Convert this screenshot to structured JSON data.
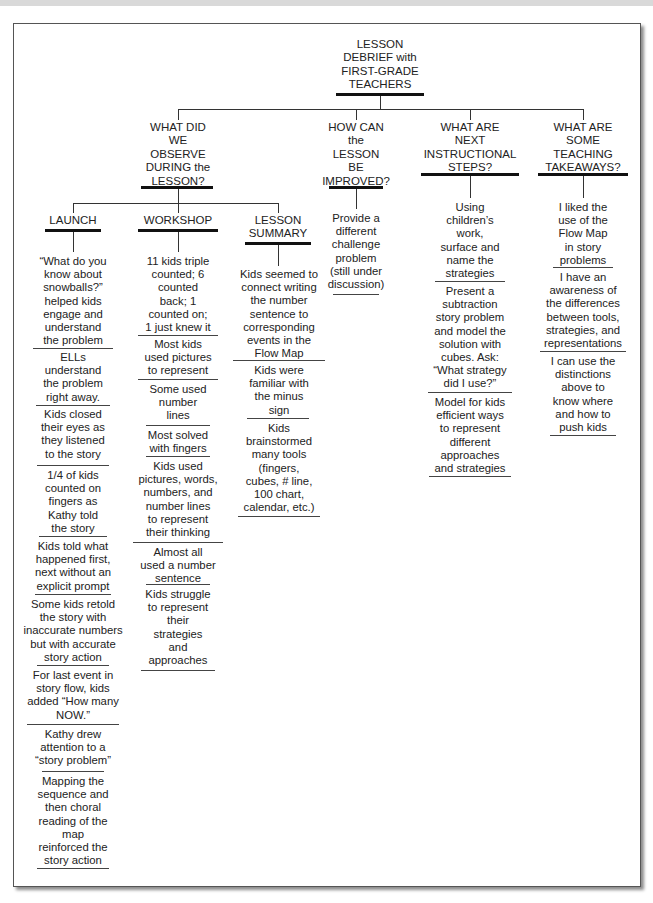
{
  "root": {
    "title": "LESSON\nDEBRIEF with\nFIRST-GRADE\nTEACHERS"
  },
  "questions": [
    {
      "id": "observe",
      "label": "WHAT DID\nWE\nOBSERVE\nDURING the\nLESSON?",
      "subcategories": [
        {
          "label": "LAUNCH",
          "items": [
            "“What do you\nknow about\nsnowballs?”\nhelped kids\nengage and\nunderstand\nthe problem",
            "ELLs\nunderstand\nthe problem\nright away.",
            "Kids closed\ntheir eyes as\nthey listened\nto the story",
            "1/4 of kids\ncounted on\nfingers as\nKathy told\nthe story",
            "Kids told what\nhappened first,\nnext without an\nexplicit prompt",
            "Some kids retold\nthe  story with\ninaccurate numbers\nbut with accurate\nstory action",
            "For last event in\nstory flow, kids\nadded “How many\nNOW.”",
            "Kathy drew\nattention to a\n“story problem”",
            "Mapping the\nsequence and\nthen choral\nreading of the\nmap\nreinforced the\nstory action"
          ]
        },
        {
          "label": "WORKSHOP",
          "items": [
            "11 kids triple\ncounted; 6\ncounted\nback; 1\ncounted on;\n1 just knew it",
            "Most kids\nused pictures\nto represent",
            "Some used\nnumber\nlines",
            "Most solved\nwith fingers",
            "Kids used\npictures, words,\nnumbers, and\nnumber lines\nto represent\ntheir thinking",
            "Almost all\nused a number\nsentence",
            "Kids struggle\nto represent\ntheir\nstrategies\nand\napproaches"
          ]
        },
        {
          "label": "LESSON\nSUMMARY",
          "items": [
            "Kids seemed to\nconnect writing\nthe number\nsentence to\ncorresponding\nevents in the\nFlow Map",
            "Kids were\nfamiliar with\nthe minus\nsign",
            "Kids\nbrainstormed\nmany tools\n(fingers,\ncubes, # line,\n100 chart,\ncalendar, etc.)"
          ]
        }
      ]
    },
    {
      "id": "improve",
      "label": "HOW CAN\nthe\nLESSON\nBE\nIMPROVED?",
      "items": [
        "Provide a\ndifferent\nchallenge\nproblem\n(still under\ndiscussion)"
      ]
    },
    {
      "id": "next",
      "label": "WHAT ARE\nNEXT\nINSTRUCTIONAL\nSTEPS?",
      "items": [
        "Using\nchildren’s\nwork,\nsurface and\nname the\nstrategies",
        "Present a\nsubtraction\nstory problem\nand model the\nsolution with\ncubes. Ask:\n“What strategy\ndid I use?”",
        "Model for kids\nefficient ways\nto represent\ndifferent\napproaches\nand strategies"
      ]
    },
    {
      "id": "takeaways",
      "label": "WHAT ARE\nSOME\nTEACHING\nTAKEAWAYS?",
      "items": [
        "I liked the\nuse of the\nFlow Map\nin story\nproblems",
        "I have an\nawareness of\nthe differences\nbetween tools,\nstrategies, and\nrepresentations",
        "I can use the\ndistinctions\nabove to\nknow where\nand how to\npush kids"
      ]
    }
  ]
}
